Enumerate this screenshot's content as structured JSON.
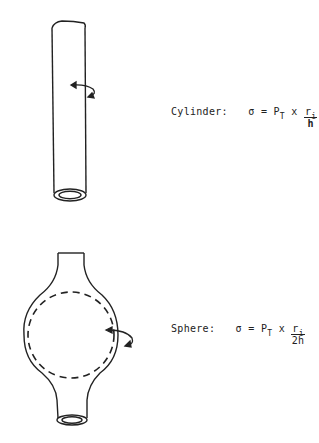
{
  "cylinder": {
    "label": "Cylinder:",
    "sigma": "σ",
    "equals": "=",
    "p": "P",
    "p_sub": "T",
    "times": "x",
    "r": "r",
    "r_sub": "i",
    "denominator": "h"
  },
  "sphere": {
    "label": "Sphere:",
    "sigma": "σ",
    "equals": "=",
    "p": "P",
    "p_sub": "T",
    "times": "x",
    "r": "r",
    "r_sub": "i",
    "denominator": "2h"
  }
}
